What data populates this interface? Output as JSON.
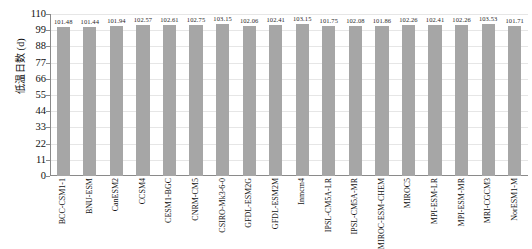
{
  "chart_data": {
    "type": "bar",
    "title": "",
    "xlabel": "",
    "ylabel": "低温日数 (d)",
    "ylim": [
      0,
      110
    ],
    "ytick_step": 11,
    "yticks": [
      110,
      99,
      88,
      77,
      66,
      55,
      44,
      33,
      22,
      11,
      0
    ],
    "grid": true,
    "legend": "none",
    "bar_color": "#a6a6a6",
    "categories": [
      "BCC-CSM1-1",
      "BNU-ESM",
      "CanESM2",
      "CCSM4",
      "CESM1-BGC",
      "CNRM-CM5",
      "CSIRO-Mk3-6-0",
      "GFDL-ESM2G",
      "GFDL-ESM2M",
      "Inmcm4",
      "IPSL-CM5A-LR",
      "IPSL-CM5A-MR",
      "MIROC-ESM-CHEM",
      "MIROC5",
      "MPI-ESM-LR",
      "MPI-ESM-MR",
      "MRI-CGCM3",
      "NorESM1-M"
    ],
    "values": [
      101.48,
      101.44,
      101.94,
      102.57,
      102.61,
      102.75,
      103.15,
      102.06,
      102.41,
      103.15,
      101.75,
      102.08,
      101.86,
      102.26,
      102.41,
      102.26,
      103.53,
      101.71
    ],
    "value_labels": [
      "101.48",
      "101.44",
      "101.94",
      "102.57",
      "102.61",
      "102.75",
      "103.15",
      "102.06",
      "102.41",
      "103.15",
      "101.75",
      "102.08",
      "101.86",
      "102.26",
      "102.41",
      "102.26",
      "103.53",
      "101.71"
    ]
  }
}
